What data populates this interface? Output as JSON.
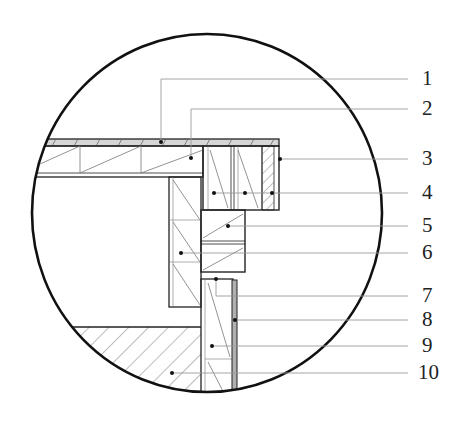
{
  "diagram": {
    "type": "construction-detail-section",
    "callouts": [
      {
        "number": "1",
        "y": 79
      },
      {
        "number": "2",
        "y": 109
      },
      {
        "number": "3",
        "y": 159
      },
      {
        "number": "4",
        "y": 193
      },
      {
        "number": "5",
        "y": 226
      },
      {
        "number": "6",
        "y": 253
      },
      {
        "number": "7",
        "y": 296
      },
      {
        "number": "8",
        "y": 320
      },
      {
        "number": "9",
        "y": 346
      },
      {
        "number": "10",
        "y": 373
      }
    ],
    "colors": {
      "line": "#222222",
      "leader": "#9a9a9a",
      "strip": "#b0b0b0"
    }
  }
}
